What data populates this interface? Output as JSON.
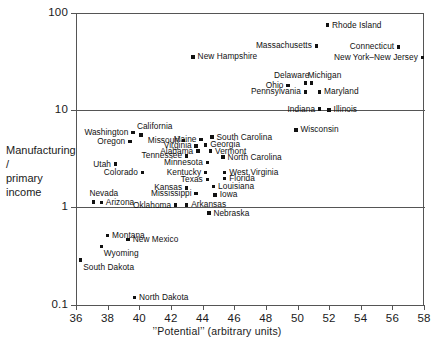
{
  "chart_data": {
    "type": "scatter",
    "title": "",
    "xlabel": "’’Potential’’  (arbitrary units)",
    "ylabel": "Manufacturing /\nprimary income",
    "ylabel_line1": "Manufacturing /",
    "ylabel_line2": "primary income",
    "xlim": [
      36,
      58
    ],
    "ylim": [
      0.1,
      100
    ],
    "yscale": "log",
    "xscale": "linear",
    "xticks": [
      36,
      38,
      40,
      42,
      44,
      46,
      48,
      50,
      52,
      54,
      56,
      58
    ],
    "yticks": [
      0.1,
      1,
      10,
      100
    ],
    "ytick_labels": [
      "0.1",
      "1",
      "10",
      "100"
    ],
    "grid": "horizontal-major",
    "legend": "none",
    "points": [
      {
        "label": "Rhode Island",
        "x": 51.9,
        "y": 75.0,
        "lp": "right"
      },
      {
        "label": "Massachusetts",
        "x": 51.2,
        "y": 46.0,
        "lp": "left"
      },
      {
        "label": "Connecticut",
        "x": 56.4,
        "y": 45.0,
        "lp": "left"
      },
      {
        "label": "New York–New Jersey",
        "x": 57.9,
        "y": 35.0,
        "lp": "left"
      },
      {
        "label": "New Hampshire",
        "x": 43.4,
        "y": 35.5,
        "lp": "right"
      },
      {
        "label": "Delaware",
        "x": 50.5,
        "y": 19.0,
        "lp": "above-left"
      },
      {
        "label": "Michigan",
        "x": 50.9,
        "y": 19.0,
        "lp": "above-right"
      },
      {
        "label": "Ohio",
        "x": 49.4,
        "y": 18.0,
        "lp": "left"
      },
      {
        "label": "Maryland",
        "x": 51.4,
        "y": 15.5,
        "lp": "right"
      },
      {
        "label": "Pennsylvania",
        "x": 50.5,
        "y": 15.5,
        "lp": "left"
      },
      {
        "label": "Indiana",
        "x": 51.4,
        "y": 10.3,
        "lp": "left"
      },
      {
        "label": "Illinois",
        "x": 52.0,
        "y": 10.1,
        "lp": "right"
      },
      {
        "label": "Wisconsin",
        "x": 49.9,
        "y": 6.3,
        "lp": "right"
      },
      {
        "label": "Washington",
        "x": 39.6,
        "y": 5.9,
        "lp": "left"
      },
      {
        "label": "California",
        "x": 40.1,
        "y": 5.6,
        "lp": "above-right"
      },
      {
        "label": "Oregon",
        "x": 39.4,
        "y": 4.8,
        "lp": "left"
      },
      {
        "label": "Missouri",
        "x": 42.8,
        "y": 4.9,
        "lp": "left"
      },
      {
        "label": "Maine",
        "x": 43.9,
        "y": 5.0,
        "lp": "left"
      },
      {
        "label": "South Carolina",
        "x": 44.6,
        "y": 5.3,
        "lp": "right"
      },
      {
        "label": "Virginia",
        "x": 43.6,
        "y": 4.3,
        "lp": "left"
      },
      {
        "label": "Georgia",
        "x": 44.2,
        "y": 4.4,
        "lp": "right"
      },
      {
        "label": "Alabama",
        "x": 43.7,
        "y": 3.8,
        "lp": "left"
      },
      {
        "label": "Vermont",
        "x": 44.5,
        "y": 3.8,
        "lp": "right"
      },
      {
        "label": "Tennessee",
        "x": 43.0,
        "y": 3.4,
        "lp": "left"
      },
      {
        "label": "North Carolina",
        "x": 45.3,
        "y": 3.3,
        "lp": "right"
      },
      {
        "label": "Minnesota",
        "x": 44.3,
        "y": 2.9,
        "lp": "left"
      },
      {
        "label": "Utah",
        "x": 38.5,
        "y": 2.8,
        "lp": "left"
      },
      {
        "label": "Kentucky",
        "x": 44.2,
        "y": 2.3,
        "lp": "left"
      },
      {
        "label": "West Virginia",
        "x": 45.4,
        "y": 2.3,
        "lp": "right"
      },
      {
        "label": "Colorado",
        "x": 40.2,
        "y": 2.3,
        "lp": "left"
      },
      {
        "label": "Texas",
        "x": 44.3,
        "y": 1.95,
        "lp": "left"
      },
      {
        "label": "Florida",
        "x": 45.4,
        "y": 2.0,
        "lp": "right"
      },
      {
        "label": "Kansas",
        "x": 43.0,
        "y": 1.6,
        "lp": "left"
      },
      {
        "label": "Louisiana",
        "x": 44.7,
        "y": 1.65,
        "lp": "right"
      },
      {
        "label": "Mississippi",
        "x": 43.6,
        "y": 1.4,
        "lp": "left"
      },
      {
        "label": "Iowa",
        "x": 44.8,
        "y": 1.35,
        "lp": "right"
      },
      {
        "label": "Nevada",
        "x": 37.1,
        "y": 1.15,
        "lp": "above-right"
      },
      {
        "label": "Arizona",
        "x": 37.6,
        "y": 1.13,
        "lp": "right"
      },
      {
        "label": "Oklahoma",
        "x": 42.3,
        "y": 1.06,
        "lp": "left"
      },
      {
        "label": "Arkansas",
        "x": 43.0,
        "y": 1.07,
        "lp": "right"
      },
      {
        "label": "Nebraska",
        "x": 44.4,
        "y": 0.88,
        "lp": "right"
      },
      {
        "label": "Montana",
        "x": 38.0,
        "y": 0.52,
        "lp": "right"
      },
      {
        "label": "New Mexico",
        "x": 39.3,
        "y": 0.47,
        "lp": "right"
      },
      {
        "label": "Wyoming",
        "x": 37.6,
        "y": 0.4,
        "lp": "right-below"
      },
      {
        "label": "South Dakota",
        "x": 36.3,
        "y": 0.29,
        "lp": "right-below"
      },
      {
        "label": "North Dakota",
        "x": 39.7,
        "y": 0.12,
        "lp": "right"
      }
    ]
  }
}
